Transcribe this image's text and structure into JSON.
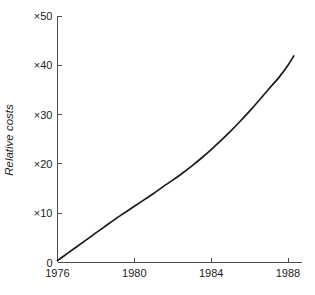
{
  "chart_data": {
    "type": "line",
    "title": "",
    "subtitle": "",
    "xlabel": "",
    "ylabel": "Relative costs",
    "xlim": [
      1976,
      1988.6
    ],
    "ylim": [
      0,
      50
    ],
    "grid": false,
    "legend": null,
    "x_tick_labels": [
      "1976",
      "1980",
      "1984",
      "1988"
    ],
    "x_tick_values": [
      1976,
      1980,
      1984,
      1988
    ],
    "y_tick_labels": [
      "0",
      "×10",
      "×20",
      "×30",
      "×40",
      "×50"
    ],
    "y_tick_values": [
      0,
      10,
      20,
      30,
      40,
      50
    ],
    "series": [
      {
        "name": "Relative costs",
        "color": "#1a1a1a",
        "x": [
          1976.0,
          1976.5,
          1977.0,
          1977.5,
          1978.0,
          1978.5,
          1979.0,
          1979.5,
          1980.0,
          1980.5,
          1981.0,
          1981.5,
          1982.0,
          1982.5,
          1983.0,
          1983.5,
          1984.0,
          1984.5,
          1985.0,
          1985.5,
          1986.0,
          1986.5,
          1987.0,
          1987.5,
          1988.0,
          1988.3
        ],
        "y": [
          0.4,
          1.8,
          3.2,
          4.6,
          6.0,
          7.4,
          8.8,
          10.1,
          11.4,
          12.7,
          14.0,
          15.4,
          16.7,
          18.1,
          19.6,
          21.2,
          22.9,
          24.7,
          26.6,
          28.6,
          30.7,
          32.9,
          35.2,
          37.4,
          40.0,
          41.9
        ]
      }
    ]
  },
  "axis": {
    "y_title": "Relative costs"
  }
}
